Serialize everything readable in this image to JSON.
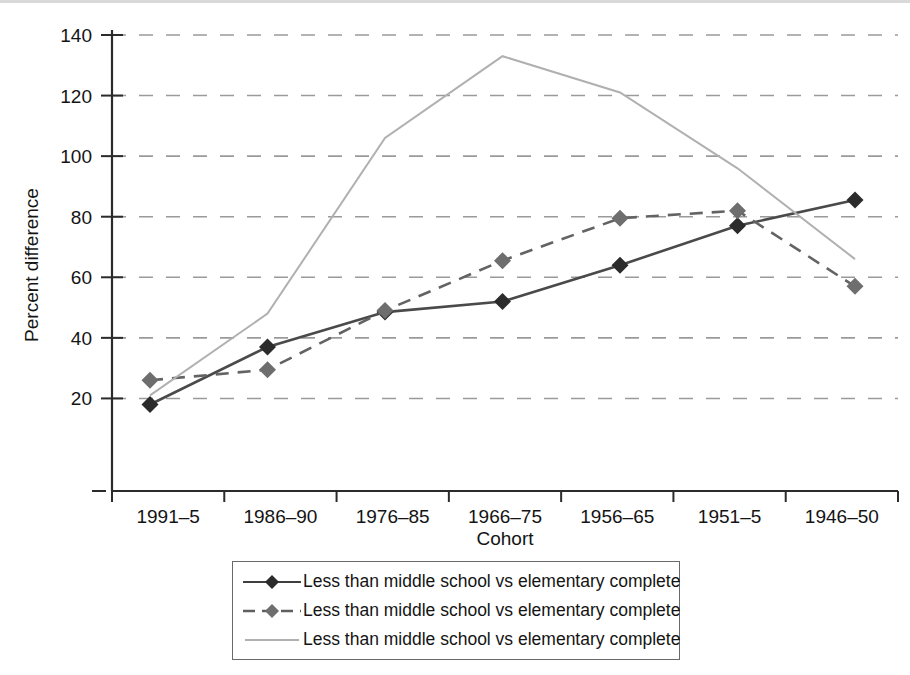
{
  "chart_data": {
    "type": "line",
    "title": "",
    "xlabel": "Cohort",
    "ylabel": "Percent difference",
    "categories": [
      "1991–5",
      "1986–90",
      "1976–85",
      "1966–75",
      "1956–65",
      "1951–5",
      "1946–50"
    ],
    "ylim": [
      0,
      140
    ],
    "yticks": [
      20,
      40,
      60,
      80,
      100,
      120,
      140
    ],
    "ytick_labels": [
      "20",
      "40",
      "60",
      "80",
      "100",
      "120",
      "140"
    ],
    "grid": "horizontal-dashed",
    "legend_position": "bottom-center",
    "series": [
      {
        "name": "Less than middle school vs elementary complete",
        "style": "solid",
        "marker": "diamond",
        "color": "#4a4a4a",
        "marker_color": "#2b2b2b",
        "values": [
          18,
          37,
          48.5,
          52,
          64,
          77,
          85.5
        ]
      },
      {
        "name": "Less than middle school vs elementary complete",
        "style": "dashed",
        "marker": "diamond",
        "color": "#636363",
        "marker_color": "#6e6e6e",
        "values": [
          26,
          29.5,
          49,
          65.5,
          79.5,
          82,
          57
        ]
      },
      {
        "name": "Less than middle school vs elementary complete",
        "style": "solid-thin",
        "marker": "none",
        "color": "#b0b0b0",
        "marker_color": "#b0b0b0",
        "values": [
          21,
          48,
          106,
          133,
          121,
          96,
          66
        ]
      }
    ]
  },
  "axes": {
    "baseline_tick_label": "–"
  },
  "legend": {
    "entries": [
      {
        "label": "Less than middle school vs elementary complete"
      },
      {
        "label": "Less than middle school vs elementary complete"
      },
      {
        "label": "Less than middle school vs elementary complete"
      }
    ]
  }
}
